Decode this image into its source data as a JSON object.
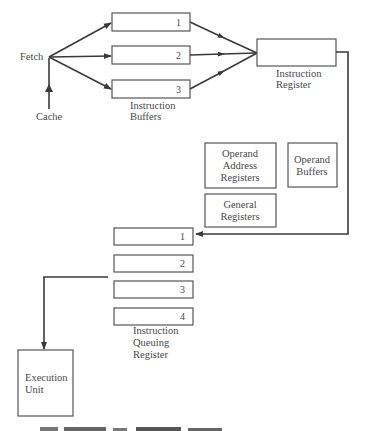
{
  "diagram": {
    "fetch_label": "Fetch",
    "cache_label": "Cache",
    "instruction_buffers": {
      "label_line1": "Instruction",
      "label_line2": "Buffers",
      "items": [
        "1",
        "2",
        "3"
      ]
    },
    "instruction_register": {
      "label_line1": "Instruction",
      "label_line2": "Register"
    },
    "operand_address_registers": {
      "line1": "Operand",
      "line2": "Address",
      "line3": "Registers"
    },
    "operand_buffers": {
      "line1": "Operand",
      "line2": "Buffers"
    },
    "general_registers": {
      "line1": "General",
      "line2": "Registers"
    },
    "instruction_queue": {
      "label_line1": "Instruction",
      "label_line2": "Queuing",
      "label_line3": "Register",
      "items": [
        "1",
        "2",
        "3",
        "4"
      ]
    },
    "execution_unit": {
      "line1": "Execution",
      "line2": "Unit"
    },
    "colors": {
      "line": "#3a3a3a",
      "box_border": "#555555",
      "text": "#4a4a4a",
      "background": "#ffffff"
    }
  }
}
